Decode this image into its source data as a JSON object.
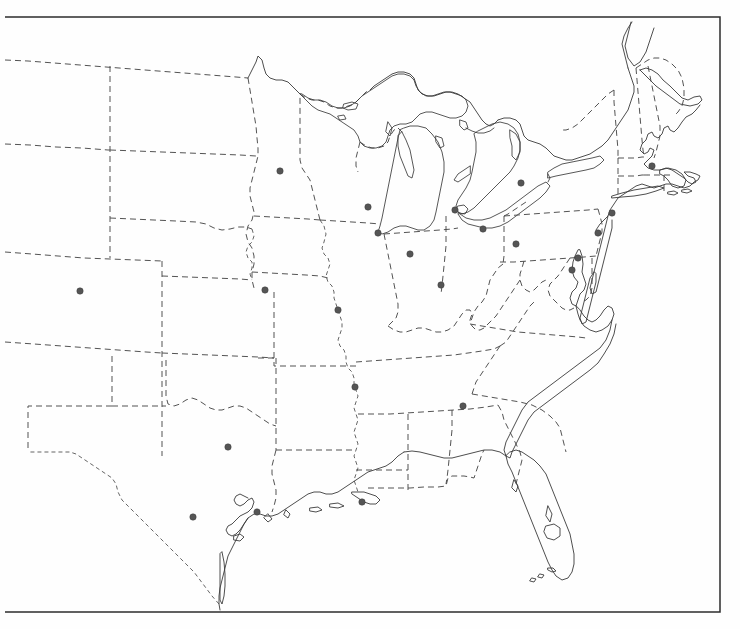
{
  "map": {
    "title": "Outline map of the eastern and central United States",
    "projection_note": "conic",
    "background_color": "#ffffff",
    "coastline_color": "#3a3a3a",
    "state_border_color": "#4a4a4a",
    "state_border_style": "dashed",
    "frame_color": "#2c2c2c",
    "city_dot_color": "#555555",
    "city_dot_radius": 3.2,
    "frame": {
      "x": 5,
      "y": 17,
      "width": 715,
      "height": 595
    },
    "cities": [
      {
        "name": "minneapolis-st-paul",
        "x": 280,
        "y": 171
      },
      {
        "name": "milwaukee",
        "x": 368,
        "y": 207
      },
      {
        "name": "chicago",
        "x": 378,
        "y": 233
      },
      {
        "name": "detroit",
        "x": 455,
        "y": 210
      },
      {
        "name": "buffalo",
        "x": 521,
        "y": 183
      },
      {
        "name": "cleveland",
        "x": 483,
        "y": 229
      },
      {
        "name": "pittsburgh",
        "x": 516,
        "y": 244
      },
      {
        "name": "boston",
        "x": 652,
        "y": 166
      },
      {
        "name": "new-york",
        "x": 612,
        "y": 213
      },
      {
        "name": "philadelphia",
        "x": 598,
        "y": 233
      },
      {
        "name": "baltimore",
        "x": 578,
        "y": 258
      },
      {
        "name": "washington-dc",
        "x": 572,
        "y": 270
      },
      {
        "name": "indianapolis",
        "x": 410,
        "y": 254
      },
      {
        "name": "cincinnati",
        "x": 441,
        "y": 285
      },
      {
        "name": "kansas-city",
        "x": 265,
        "y": 290
      },
      {
        "name": "st-louis",
        "x": 338,
        "y": 310
      },
      {
        "name": "denver",
        "x": 80,
        "y": 291
      },
      {
        "name": "memphis",
        "x": 355,
        "y": 387
      },
      {
        "name": "atlanta",
        "x": 463,
        "y": 406
      },
      {
        "name": "dallas",
        "x": 228,
        "y": 447
      },
      {
        "name": "houston",
        "x": 257,
        "y": 512
      },
      {
        "name": "san-antonio",
        "x": 193,
        "y": 517
      },
      {
        "name": "new-orleans",
        "x": 362,
        "y": 502
      }
    ],
    "regions_shown": [
      "great-lakes",
      "new-england",
      "mid-atlantic",
      "southeast",
      "florida-peninsula",
      "gulf-coast",
      "texas",
      "great-plains",
      "midwest"
    ]
  }
}
